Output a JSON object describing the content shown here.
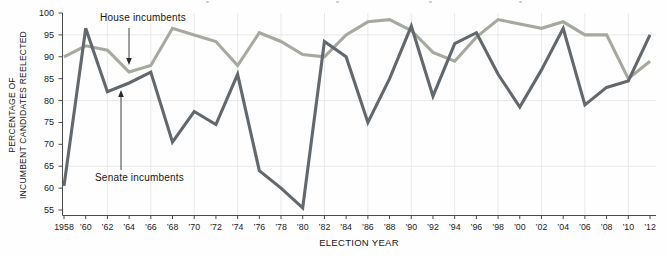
{
  "chart_data": {
    "type": "line",
    "xlabel": "ELECTION YEAR",
    "ylabel_lines": [
      "PERCENTAGE OF",
      "INCUMBENT CANDIDATES REELECTED"
    ],
    "ylim": [
      55,
      100
    ],
    "y_ticks": [
      55,
      60,
      65,
      70,
      75,
      80,
      85,
      90,
      95,
      100
    ],
    "grid": true,
    "legend_position": "annotated-on-chart",
    "categories": [
      "1958",
      "’60",
      "’62",
      "’64",
      "’66",
      "’68",
      "’70",
      "’72",
      "’74",
      "’76",
      "’78",
      "’80",
      "’82",
      "’84",
      "’86",
      "’88",
      "’90",
      "’92",
      "’94",
      "’96",
      "’98",
      "’00",
      "’02",
      "’04",
      "’06",
      "’08",
      "’10",
      "’12"
    ],
    "series": [
      {
        "name": "House incumbents",
        "color": "#a5a99f",
        "values": [
          90,
          92.5,
          91.5,
          86.5,
          88,
          96.5,
          95,
          93.5,
          88,
          95.5,
          93.5,
          90.5,
          90,
          95,
          98,
          98.5,
          96,
          91,
          89,
          94.5,
          98.5,
          97.5,
          96.5,
          98,
          95,
          95,
          85,
          89
        ]
      },
      {
        "name": "Senate incumbents",
        "color": "#63686d",
        "values": [
          60.5,
          96.5,
          82,
          84,
          86.5,
          70.5,
          77.5,
          74.5,
          86,
          64,
          60,
          55.5,
          93.5,
          90,
          75,
          85,
          97,
          81,
          93,
          95.5,
          86,
          78.5,
          87,
          96.5,
          79,
          83,
          84.5,
          95
        ]
      }
    ],
    "annotations": [
      {
        "text": "House incumbents",
        "points_to": "House line near 1964"
      },
      {
        "text": "Senate incumbents",
        "points_to": "Senate line near 1963"
      }
    ]
  },
  "axis_style": {
    "axis_color": "#4b4b4b",
    "grid_color": "#e9e9e9",
    "tick_label_color": "#1c1c1c"
  }
}
